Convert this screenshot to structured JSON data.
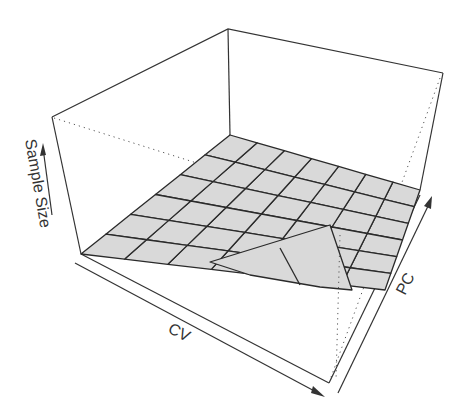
{
  "chart_data": {
    "type": "surface3d",
    "title": "",
    "xlabel": "CV",
    "ylabel": "PC",
    "zlabel": "Sample Size",
    "grid": false,
    "ticks": "none (arrow-only axes)",
    "surface": {
      "grid_cols": 7,
      "grid_rows": 6,
      "description": "Mostly flat surface near minimum Sample Size across CV and PC, with a sharp rise/fold at the high-CV, low-PC corner",
      "z_relative": [
        [
          0,
          0,
          0,
          0,
          0,
          0,
          0
        ],
        [
          0,
          0,
          0,
          0,
          0,
          0,
          0
        ],
        [
          0,
          0,
          0,
          0,
          0,
          0,
          0
        ],
        [
          0,
          0,
          0,
          0,
          0,
          0,
          0.02
        ],
        [
          0,
          0,
          0,
          0,
          0,
          0.05,
          0.1
        ],
        [
          0,
          0,
          0,
          0.02,
          0.1,
          0.35,
          0.15
        ]
      ]
    },
    "colors": {
      "surface_fill": "#d9d9d9",
      "mesh": "#2a2a2a",
      "box": "#333333"
    }
  },
  "labels": {
    "z_axis": "Sample Size",
    "x_axis": "CV",
    "y_axis": "PC"
  }
}
